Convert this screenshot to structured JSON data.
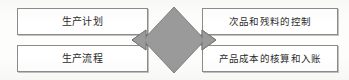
{
  "diagram": {
    "type": "process-relationship-diagram",
    "background_color": "#fdfdfc",
    "nodes": [
      {
        "id": "production-plan",
        "label": "生产计划",
        "position": "top-left",
        "fill_color": "#ffffff",
        "border_color": "#8c8c8c"
      },
      {
        "id": "production-process",
        "label": "生产流程",
        "position": "bottom-left",
        "fill_color": "#ffffff",
        "border_color": "#8c8c8c"
      },
      {
        "id": "defect-control",
        "label": "次品和残料的控制",
        "position": "top-right",
        "fill_color": "#ffffff",
        "border_color": "#8c8c8c"
      },
      {
        "id": "cost-accounting",
        "label": "产品成本的核算和入账",
        "position": "bottom-right",
        "fill_color": "#ffffff",
        "border_color": "#8c8c8c"
      }
    ],
    "connector": {
      "id": "bidirectional-link",
      "shape": "diamond-with-double-arrow",
      "direction": "left-right",
      "fill_color": "#9a9a9a",
      "stroke_color": "#6f6f6f"
    }
  }
}
